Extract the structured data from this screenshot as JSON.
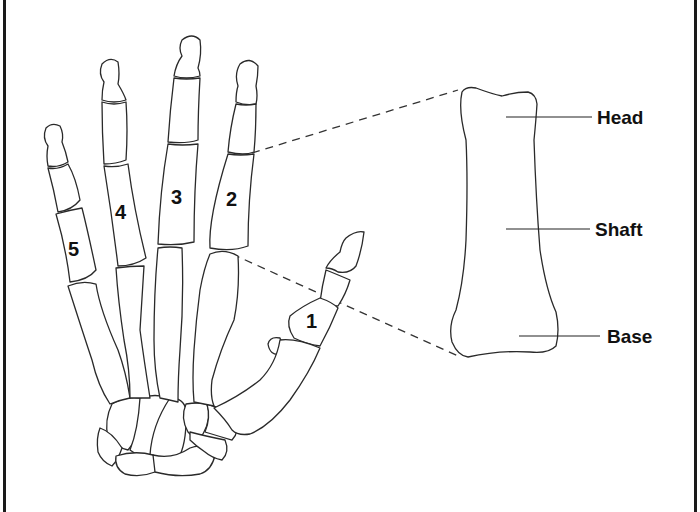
{
  "diagram": {
    "metacarpal_numbers": [
      {
        "id": "mc1",
        "label": "1",
        "x": 312,
        "y": 328
      },
      {
        "id": "mc2",
        "label": "2",
        "x": 232,
        "y": 206
      },
      {
        "id": "mc3",
        "label": "3",
        "x": 177,
        "y": 204
      },
      {
        "id": "mc4",
        "label": "4",
        "x": 121,
        "y": 219
      },
      {
        "id": "mc5",
        "label": "5",
        "x": 76,
        "y": 256
      }
    ],
    "detail_labels": {
      "head": "Head",
      "shaft": "Shaft",
      "base": "Base"
    },
    "colors": {
      "line": "#2a2a2a",
      "background": "#ffffff",
      "border": "#1a1a1a",
      "text": "#111111"
    }
  }
}
